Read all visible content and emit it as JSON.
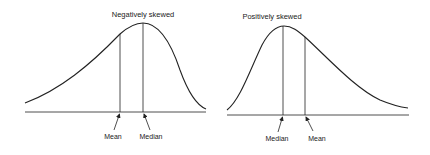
{
  "diagrams": [
    {
      "title": "Negatively skewed",
      "skew": "negative",
      "markers": [
        {
          "label": "Mean",
          "role": "mean"
        },
        {
          "label": "Median",
          "role": "median"
        }
      ]
    },
    {
      "title": "Positively skewed",
      "skew": "positive",
      "markers": [
        {
          "label": "Median",
          "role": "median"
        },
        {
          "label": "Mean",
          "role": "mean"
        }
      ]
    }
  ]
}
